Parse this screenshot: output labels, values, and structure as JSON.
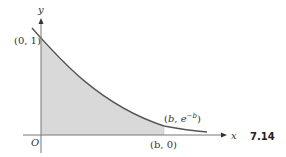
{
  "figure": {
    "number": "7.14",
    "axes": {
      "x_label": "x",
      "y_label": "y",
      "origin_label": "O"
    },
    "curve": "y = e^(-x)",
    "points": [
      {
        "label_open": "(0, 1)"
      },
      {
        "label_b": "b",
        "label_sep": ", ",
        "label_e": "e",
        "label_exp": "−b"
      },
      {
        "label": "(b, 0)"
      }
    ],
    "shaded_region": "area under y = e^(-x) from x = 0 to x = b",
    "colors": {
      "curve": "#555555",
      "shade": "#d9d9d9",
      "axis": "#777777"
    }
  }
}
